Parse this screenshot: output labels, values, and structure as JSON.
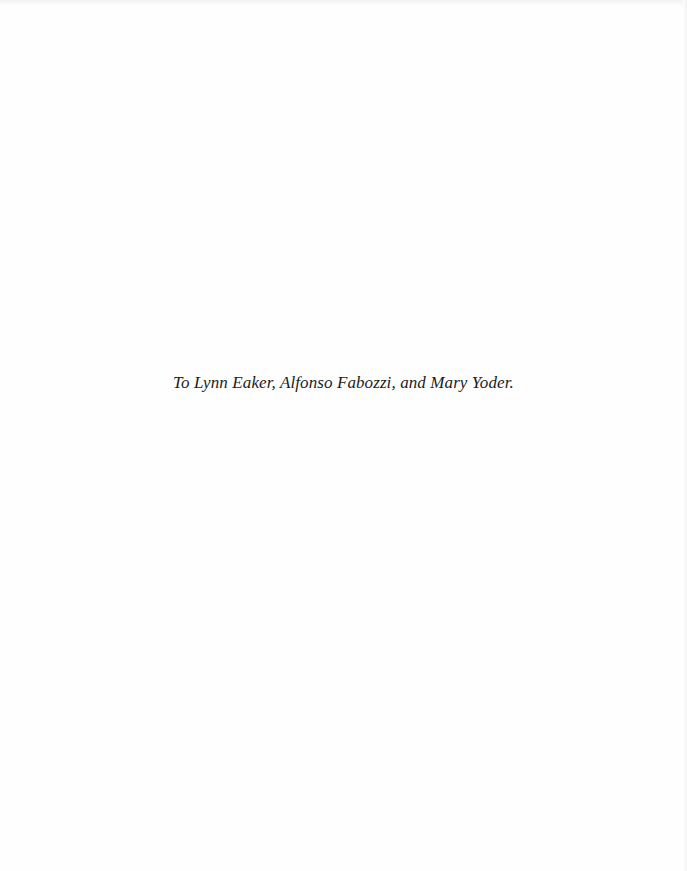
{
  "page": {
    "type": "dedication-page",
    "dedication_text": "To Lynn Eaker, Alfonso Fabozzi, and Mary Yoder."
  }
}
